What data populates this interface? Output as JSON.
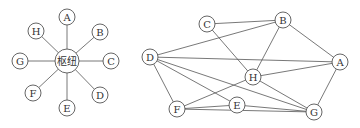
{
  "diagrams": [
    {
      "name": "star-topology",
      "hub": {
        "label": "枢纽",
        "x": 67,
        "y": 61,
        "r": 12
      },
      "nodes": [
        {
          "label": "A",
          "x": 67,
          "y": 17
        },
        {
          "label": "B",
          "x": 100,
          "y": 32
        },
        {
          "label": "C",
          "x": 111,
          "y": 61
        },
        {
          "label": "D",
          "x": 100,
          "y": 95
        },
        {
          "label": "E",
          "x": 67,
          "y": 108
        },
        {
          "label": "F",
          "x": 33,
          "y": 93
        },
        {
          "label": "G",
          "x": 20,
          "y": 61
        },
        {
          "label": "H",
          "x": 36,
          "y": 31
        }
      ]
    },
    {
      "name": "mesh-topology",
      "nodes": [
        {
          "label": "A",
          "x": 340,
          "y": 62
        },
        {
          "label": "B",
          "x": 283,
          "y": 20
        },
        {
          "label": "C",
          "x": 207,
          "y": 24
        },
        {
          "label": "D",
          "x": 150,
          "y": 57
        },
        {
          "label": "E",
          "x": 237,
          "y": 105
        },
        {
          "label": "F",
          "x": 177,
          "y": 109
        },
        {
          "label": "G",
          "x": 314,
          "y": 112
        },
        {
          "label": "H",
          "x": 253,
          "y": 77
        }
      ],
      "edges": [
        [
          "C",
          "B"
        ],
        [
          "D",
          "B"
        ],
        [
          "C",
          "H"
        ],
        [
          "B",
          "H"
        ],
        [
          "B",
          "A"
        ],
        [
          "D",
          "A"
        ],
        [
          "D",
          "E"
        ],
        [
          "D",
          "G"
        ],
        [
          "D",
          "F"
        ],
        [
          "H",
          "A"
        ],
        [
          "H",
          "G"
        ],
        [
          "H",
          "F"
        ],
        [
          "A",
          "G"
        ],
        [
          "F",
          "E"
        ],
        [
          "F",
          "G"
        ],
        [
          "E",
          "G"
        ]
      ]
    }
  ]
}
